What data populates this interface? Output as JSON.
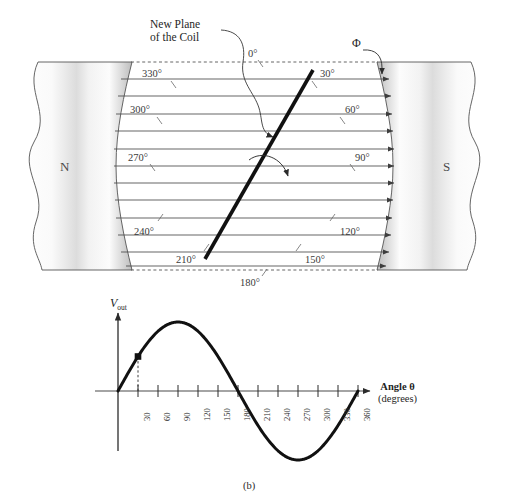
{
  "figure": {
    "caption": "(b)",
    "panel_a": {
      "poles": [
        {
          "label": "N",
          "name": "north-pole",
          "x": 60,
          "y": 160
        },
        {
          "label": "S",
          "name": "south-pole",
          "x": 443,
          "y": 160
        }
      ],
      "annotations": {
        "coil_plane_line1": "New Plane",
        "coil_plane_line2": "of the Coil",
        "flux_symbol": "Φ"
      },
      "angle_labels": [
        {
          "text": "0°",
          "x": 248,
          "y": 48,
          "tick": {
            "x1": 258,
            "y1": 60,
            "x2": 263,
            "y2": 67
          }
        },
        {
          "text": "330°",
          "x": 142,
          "y": 68,
          "tick": {
            "x1": 171,
            "y1": 81,
            "x2": 176,
            "y2": 88
          }
        },
        {
          "text": "300°",
          "x": 130,
          "y": 104,
          "tick": {
            "x1": 157,
            "y1": 117,
            "x2": 162,
            "y2": 124
          }
        },
        {
          "text": "270°",
          "x": 128,
          "y": 152,
          "tick": {
            "x1": 150,
            "y1": 164,
            "x2": 155,
            "y2": 171
          }
        },
        {
          "text": "240°",
          "x": 134,
          "y": 226,
          "tick": {
            "x1": 158,
            "y1": 221,
            "x2": 163,
            "y2": 214
          }
        },
        {
          "text": "210°",
          "x": 176,
          "y": 254,
          "tick": {
            "x1": 204,
            "y1": 251,
            "x2": 209,
            "y2": 244
          }
        },
        {
          "text": "180°",
          "x": 240,
          "y": 277,
          "tick": {
            "x1": 262,
            "y1": 276,
            "x2": 267,
            "y2": 269
          }
        },
        {
          "text": "150°",
          "x": 305,
          "y": 254,
          "tick": {
            "x1": 296,
            "y1": 251,
            "x2": 301,
            "y2": 244
          }
        },
        {
          "text": "120°",
          "x": 340,
          "y": 226,
          "tick": {
            "x1": 330,
            "y1": 221,
            "x2": 335,
            "y2": 214
          }
        },
        {
          "text": "90°",
          "x": 355,
          "y": 152,
          "tick": {
            "x1": 350,
            "y1": 164,
            "x2": 355,
            "y2": 171
          }
        },
        {
          "text": "60°",
          "x": 345,
          "y": 104,
          "tick": {
            "x1": 340,
            "y1": 117,
            "x2": 345,
            "y2": 124
          }
        },
        {
          "text": "30°",
          "x": 320,
          "y": 68,
          "tick": {
            "x1": 312,
            "y1": 81,
            "x2": 317,
            "y2": 88
          }
        }
      ]
    },
    "panel_b": {
      "y_axis_label": "V",
      "y_axis_sub": "out",
      "x_axis_label": "Angle θ",
      "x_axis_sublabel": "(degrees)",
      "marker_angle_deg": 30
    }
  },
  "chart_data": {
    "type": "line",
    "title": "",
    "xlabel": "Angle θ (degrees)",
    "ylabel": "Vout",
    "xlim": [
      0,
      375
    ],
    "ylim": [
      -1.15,
      1.15
    ],
    "grid": false,
    "legend": null,
    "tick_labels": [
      "30",
      "60",
      "90",
      "120",
      "150",
      "180",
      "210",
      "240",
      "270",
      "300",
      "330",
      "360"
    ],
    "tick_values": [
      30,
      60,
      90,
      120,
      150,
      180,
      210,
      240,
      270,
      300,
      330,
      360
    ],
    "series": [
      {
        "name": "Vout = sin(theta)",
        "x": [
          0,
          15,
          30,
          45,
          60,
          75,
          90,
          105,
          120,
          135,
          150,
          165,
          180,
          195,
          210,
          225,
          240,
          255,
          270,
          285,
          300,
          315,
          330,
          345,
          360
        ],
        "values": [
          0,
          0.259,
          0.5,
          0.707,
          0.866,
          0.966,
          1.0,
          0.966,
          0.866,
          0.707,
          0.5,
          0.259,
          0,
          -0.259,
          -0.5,
          -0.707,
          -0.866,
          -0.966,
          -1.0,
          -0.966,
          -0.866,
          -0.707,
          -0.5,
          -0.259,
          0
        ]
      }
    ],
    "annotations": [
      {
        "type": "point-marker",
        "x": 30,
        "y": 0.5,
        "label": "",
        "dashed_dropline": true
      }
    ]
  }
}
